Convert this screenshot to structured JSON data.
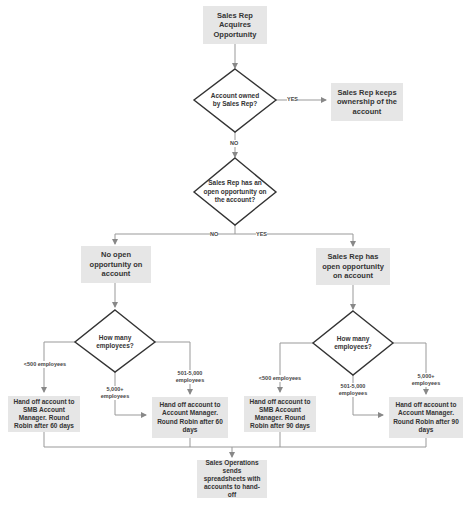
{
  "nodes": {
    "start": "Sales Rep Acquires Opportunity",
    "decision_owned": "Account owned by Sales Rep?",
    "keeps_ownership": "Sales Rep keeps ownership of the account",
    "decision_open_opp": "Sales Rep has an open opportunity on the account?",
    "no_open_opp": "No open opportunity on account",
    "has_open_opp": "Sales Rep has open opportunity on account",
    "decision_employees_left": "How many employees?",
    "decision_employees_right": "How many employees?",
    "handoff_smb_60": "Hand off account to SMB Account Manager. Round Robin after 60 days",
    "handoff_am_60": "Hand off account to Account Manager. Round Robin after 60 days",
    "handoff_smb_90": "Hand off account to SMB Account Manager. Round Robin after 90 days",
    "handoff_am_90": "Hand off account to Account Manager. Round Robin after 90 days",
    "sales_ops": "Sales Operations sends spreadsheets with accounts to hand-off"
  },
  "edge_labels": {
    "owned_yes": "YES",
    "owned_no": "NO",
    "open_no": "NO",
    "open_yes": "YES",
    "left_lt500": "<500 employees",
    "left_5000plus": "5,000+ employees",
    "left_501_5000": "501-5,000 employees",
    "right_lt500": "<500 employees",
    "right_501_5000": "501-5,000 employees",
    "right_5000plus": "5,000+ employees"
  },
  "colors": {
    "box_fill": "#e6e6e6",
    "line": "#888888",
    "diamond_stroke": "#333333"
  }
}
